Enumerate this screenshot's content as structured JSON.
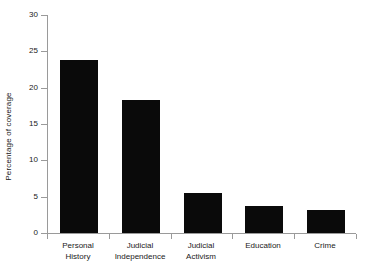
{
  "chart_data": {
    "type": "bar",
    "title": "",
    "xlabel": "",
    "ylabel": "Percentage of coverage",
    "categories": [
      "Personal History",
      "Judicial Independence",
      "Judicial Activism",
      "Education",
      "Crime"
    ],
    "values": [
      23.8,
      18.3,
      5.5,
      3.7,
      3.2
    ],
    "ylim": [
      0,
      30
    ],
    "yticks": [
      0,
      5,
      10,
      15,
      20,
      25,
      30
    ],
    "ytick_labels": [
      "0",
      "5",
      "10",
      "15",
      "20",
      "25",
      "30"
    ],
    "grid": false,
    "legend": null,
    "bar_color": "#0a0a0a",
    "axis_color": "#9a9a9a"
  },
  "axis": {
    "y_title": "Percentage of coverage"
  },
  "categories_wrapped": [
    {
      "line1": "Personal",
      "line2": "History"
    },
    {
      "line1": "Judicial",
      "line2": "Independence"
    },
    {
      "line1": "Judicial",
      "line2": "Activism"
    },
    {
      "line1": "Education",
      "line2": ""
    },
    {
      "line1": "Crime",
      "line2": ""
    }
  ]
}
